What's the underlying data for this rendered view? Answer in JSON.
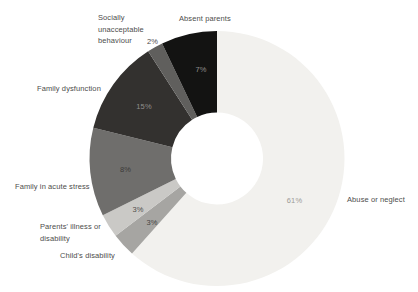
{
  "chart_data": {
    "type": "pie",
    "variant": "donut",
    "unit": "%",
    "background": "#ffffff",
    "category_label_color": "#4d4d4c",
    "direction": "clockwise",
    "start_angle_deg": 0,
    "slices": [
      {
        "id": "abuse-or-neglect",
        "label": "Abuse or neglect",
        "value": 61,
        "value_label": "61%",
        "color": "#f2f1ee",
        "value_label_color": "#9c9b98",
        "sweep_deg": 221.8,
        "value_label_pos": [
          294.5,
          203
        ]
      },
      {
        "id": "childs-disability",
        "label": "Child's disability",
        "value": 3,
        "value_label": "3%",
        "color": "#a6a5a2",
        "value_label_color": "#474644",
        "sweep_deg": 10.9,
        "value_label_pos": [
          152,
          225
        ]
      },
      {
        "id": "parents-illness-or-disability",
        "label": "Parents' illness or\ndisability",
        "value": 3,
        "value_label": "3%",
        "color": "#cac9c6",
        "value_label_color": "#514f4c",
        "sweep_deg": 10.9,
        "value_label_pos": [
          138,
          212
        ]
      },
      {
        "id": "family-in-acute-stress",
        "label": "Family in acute stress",
        "value": 8,
        "value_label": "8%",
        "color": "#6f6e6c",
        "value_label_color": "#3b3a38",
        "sweep_deg": 40.4,
        "value_label_pos": [
          125.5,
          172
        ]
      },
      {
        "id": "family-dysfunction",
        "label": "Family dysfunction",
        "value": 15,
        "value_label": "15%",
        "color": "#33312f",
        "value_label_color": "#8f8e8c",
        "sweep_deg": 43.3,
        "value_label_pos": [
          144,
          109
        ]
      },
      {
        "id": "socially-unacceptable-behaviour",
        "label": "Socially\nunacceptable\nbehaviour",
        "value": 2,
        "value_label": "2%",
        "color": "#605f5d",
        "value_label_external": true,
        "sweep_deg": 7.2
      },
      {
        "id": "absent-parents",
        "label": "Absent parents",
        "value": 7,
        "value_label": "7%",
        "color": "#131312",
        "value_label_color": "#8f8e8c",
        "sweep_deg": 25.5,
        "value_label_pos": [
          201,
          71.5
        ]
      }
    ],
    "layout": {
      "cx": 217,
      "cy": 158.5,
      "outer_radius": 127.5,
      "inner_radius": 46
    }
  }
}
